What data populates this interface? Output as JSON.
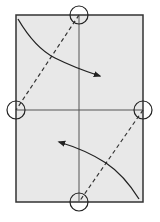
{
  "diagram": {
    "title": "",
    "type": "origami-fold",
    "colors": {
      "paper": "#e8e8e8",
      "stroke": "#333333",
      "background": "#ffffff"
    },
    "paper": {
      "x": 16,
      "y": 15,
      "width": 127,
      "height": 187
    },
    "crease_lines": [
      {
        "name": "vertical-center",
        "x1": 79,
        "y1": 15,
        "x2": 79,
        "y2": 202,
        "style": "solid"
      },
      {
        "name": "horizontal-center",
        "x1": 16,
        "y1": 110,
        "x2": 143,
        "y2": 110,
        "style": "solid"
      }
    ],
    "fold_lines": [
      {
        "name": "upper-diagonal",
        "x1": 79,
        "y1": 15,
        "x2": 16,
        "y2": 110,
        "style": "dashed"
      },
      {
        "name": "lower-diagonal",
        "x1": 143,
        "y1": 110,
        "x2": 79,
        "y2": 202,
        "style": "dashed"
      }
    ],
    "reference_points": [
      {
        "name": "top-center",
        "cx": 79,
        "cy": 15,
        "r": 9
      },
      {
        "name": "left-middle",
        "cx": 16,
        "cy": 110,
        "r": 9
      },
      {
        "name": "right-middle",
        "cx": 143,
        "cy": 110,
        "r": 9
      },
      {
        "name": "bottom-center",
        "cx": 79,
        "cy": 202,
        "r": 9
      }
    ],
    "arrows": [
      {
        "name": "upper-fold-arrow",
        "direction": "down-right"
      },
      {
        "name": "lower-fold-arrow",
        "direction": "up-left"
      }
    ]
  }
}
